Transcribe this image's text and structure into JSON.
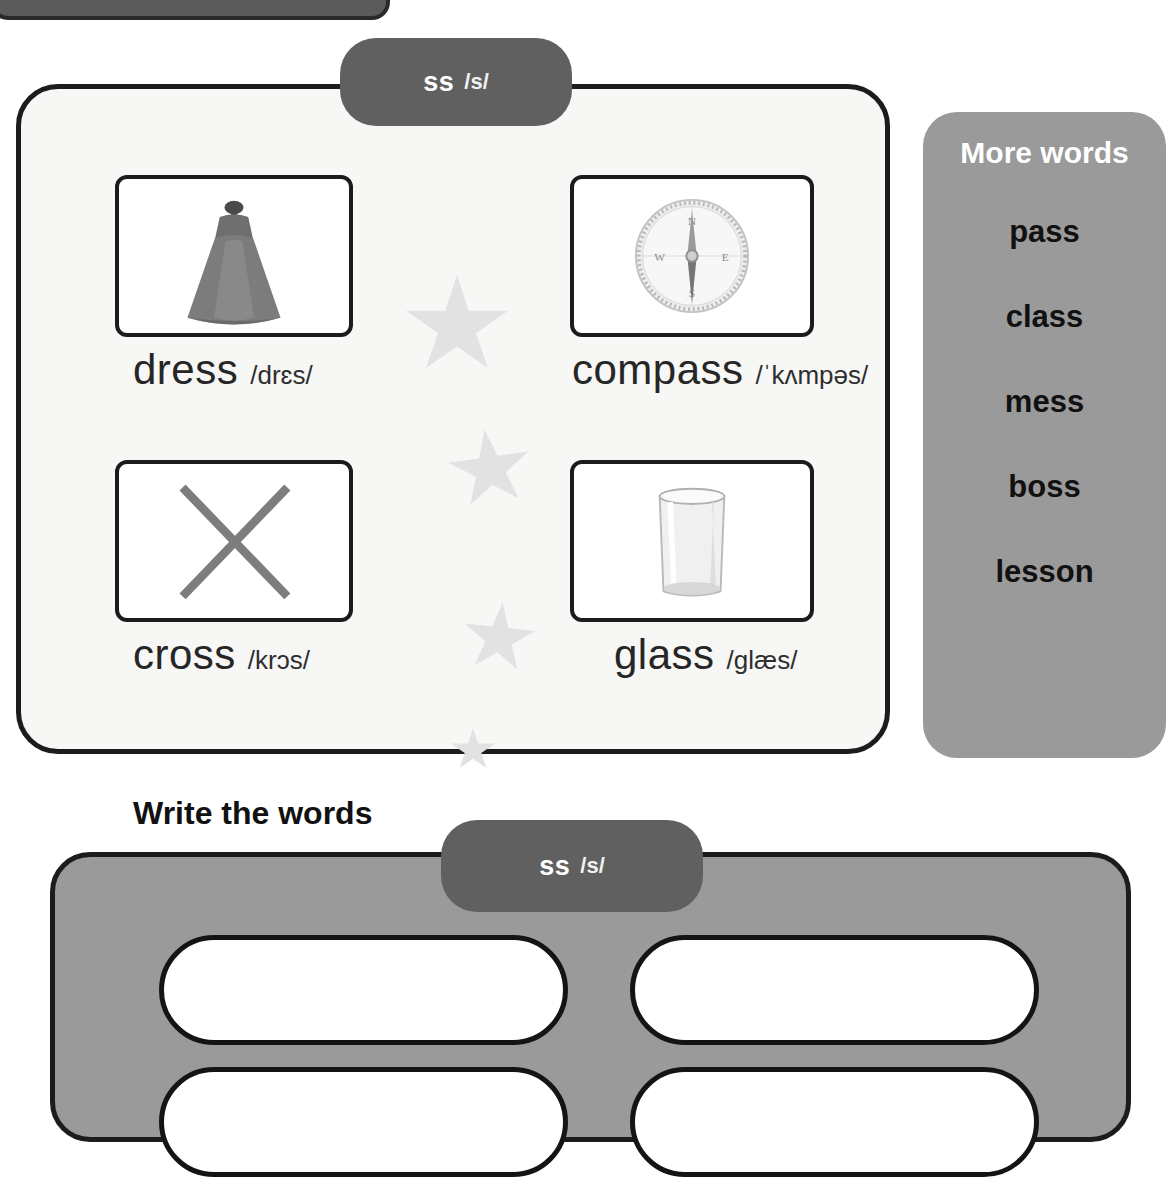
{
  "worksheet": {
    "phoneme": {
      "grapheme": "ss",
      "sound": "/s/"
    },
    "picture_panel": {
      "items": [
        {
          "word": "dress",
          "ipa": "/drɛs/",
          "image": "dress-image"
        },
        {
          "word": "compass",
          "ipa": "/ˈkʌmpəs/",
          "image": "compass-image"
        },
        {
          "word": "cross",
          "ipa": "/krɔs/",
          "image": "cross-image"
        },
        {
          "word": "glass",
          "ipa": "/glæs/",
          "image": "glass-image"
        }
      ]
    },
    "more_words": {
      "title": "More words",
      "words": [
        "pass",
        "class",
        "mess",
        "boss",
        "lesson"
      ]
    },
    "write_section": {
      "heading": "Write the words",
      "phoneme": {
        "grapheme": "ss",
        "sound": "/s/"
      },
      "boxes": [
        "",
        "",
        "",
        ""
      ]
    },
    "colors": {
      "pill": "#606060",
      "panel_bg": "#f7f7f5",
      "sidebar_bg": "#9a9a9a",
      "border": "#1c1c1c",
      "star": "#e2e2e2"
    }
  }
}
